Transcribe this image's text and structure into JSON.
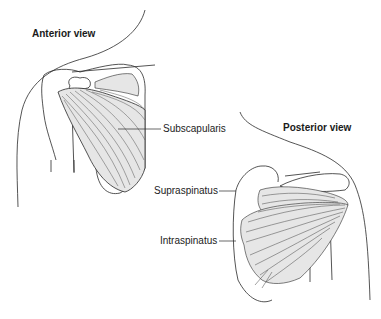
{
  "diagram": {
    "views": [
      {
        "id": "anterior",
        "title": "Anterior view",
        "labels": [
          "Subscapularis"
        ]
      },
      {
        "id": "posterior",
        "title": "Posterior view",
        "labels": [
          "Supraspinatus",
          "Intraspinatus"
        ]
      }
    ],
    "anterior_title": "Anterior view",
    "posterior_title": "Posterior view",
    "label_subscapularis": "Subscapularis",
    "label_supraspinatus": "Supraspinatus",
    "label_intraspinatus": "Intraspinatus",
    "colors": {
      "line": "#2a2a2a",
      "muscle_fill": "#e6e6e6",
      "background": "#ffffff"
    }
  }
}
